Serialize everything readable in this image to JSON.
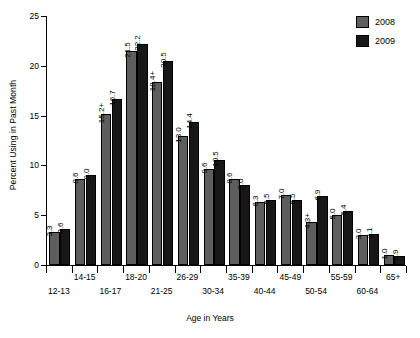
{
  "chart_data": {
    "type": "bar",
    "title": "",
    "xlabel": "Age in Years",
    "ylabel": "Percent Using in Past Month",
    "ylim": [
      0,
      25
    ],
    "yticks": [
      0,
      5,
      10,
      15,
      20,
      25
    ],
    "grid": false,
    "legend_position": "top-right",
    "categories": [
      "12-13",
      "14-15",
      "16-17",
      "18-20",
      "21-25",
      "26-29",
      "30-34",
      "35-39",
      "40-44",
      "45-49",
      "50-54",
      "55-59",
      "60-64",
      "65+"
    ],
    "series": [
      {
        "name": "2008",
        "color": "#5e5e5e",
        "values": [
          3.3,
          8.6,
          15.2,
          21.5,
          18.4,
          13.0,
          9.6,
          8.6,
          6.3,
          7.0,
          4.3,
          5.0,
          3.0,
          1.0
        ],
        "labels": [
          "3.3",
          "8.6",
          "15.2+",
          "21.5",
          "18.4+",
          "13.0",
          "9.6",
          "8.6",
          "6.3",
          "7.0",
          "4.3+",
          "5.0",
          "3.0",
          "1.0"
        ]
      },
      {
        "name": "2009",
        "color": "#171717",
        "values": [
          3.6,
          9.0,
          16.7,
          22.2,
          20.5,
          14.4,
          10.5,
          8.0,
          6.5,
          6.5,
          6.9,
          5.4,
          3.1,
          0.9
        ],
        "labels": [
          "3.6",
          "9.0",
          "16.7",
          "22.2",
          "20.5",
          "14.4",
          "10.5",
          "8.0",
          "6.5",
          "6.5",
          "6.9",
          "5.4",
          "3.1",
          "0.9"
        ]
      }
    ]
  },
  "legend": {
    "items": [
      {
        "label": "2008",
        "color": "#5e5e5e"
      },
      {
        "label": "2009",
        "color": "#171717"
      }
    ]
  }
}
